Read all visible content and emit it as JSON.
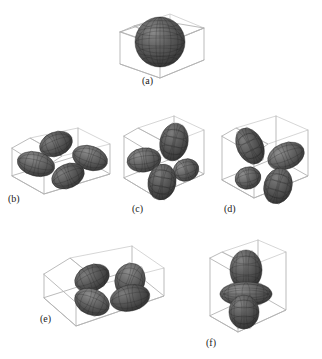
{
  "figure": {
    "background_color": "#ffffff",
    "surface_color": "#5a5a5a",
    "surface_shade_dark": "#3d3d3d",
    "surface_shade_light": "#777777",
    "mesh_color": "#1c1c1c",
    "box_color": "#b3b3b3",
    "label_color": "#1a1a1a",
    "width": 322,
    "height": 359
  },
  "panels": [
    {
      "id": "a",
      "label": "(a)",
      "shape": "sphere",
      "description": "single spherical isosurface centered in a cube",
      "lobe_count": 1,
      "has_torus": false,
      "box": "cube"
    },
    {
      "id": "b",
      "label": "(b)",
      "shape": "four-lobe-cloverleaf",
      "description": "four lobes in a cross arrangement inside a flat wide box",
      "lobe_count": 4,
      "has_torus": false,
      "box": "flat-wide"
    },
    {
      "id": "c",
      "label": "(c)",
      "shape": "four-lobe-cloverleaf",
      "description": "four lobes in a cross arrangement inside a tall box",
      "lobe_count": 4,
      "has_torus": false,
      "box": "tall"
    },
    {
      "id": "d",
      "label": "(d)",
      "shape": "four-lobe-cloverleaf",
      "description": "four lobes in a cross arrangement inside an upright box",
      "lobe_count": 4,
      "has_torus": false,
      "box": "upright"
    },
    {
      "id": "e",
      "label": "(e)",
      "shape": "four-lobe-cloverleaf",
      "description": "four lobes lying in a horizontal plane inside a shallow wide box",
      "lobe_count": 4,
      "has_torus": false,
      "box": "shallow-wide"
    },
    {
      "id": "f",
      "label": "(f)",
      "shape": "two-lobe-with-torus",
      "description": "upper and lower vertical lobes with an equatorial ring inside a tall box",
      "lobe_count": 2,
      "has_torus": true,
      "box": "tall-narrow"
    }
  ]
}
